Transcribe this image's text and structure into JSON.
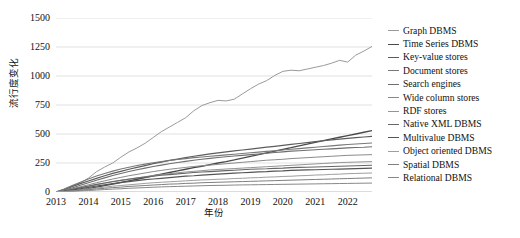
{
  "chart_data": {
    "type": "line",
    "title": "",
    "xlabel": "年份",
    "ylabel": "流行度变化",
    "xlim": [
      2013.0,
      2022.75
    ],
    "ylim": [
      0,
      1500
    ],
    "yticks": [
      0,
      250,
      500,
      750,
      1000,
      1250,
      1500
    ],
    "xticks": [
      2013,
      2014,
      2015,
      2016,
      2017,
      2018,
      2019,
      2020,
      2021,
      2022
    ],
    "grid": "horizontal",
    "legend_position": "right",
    "x": [
      2013.0,
      2013.25,
      2013.5,
      2013.75,
      2014.0,
      2014.25,
      2014.5,
      2014.75,
      2015.0,
      2015.25,
      2015.5,
      2015.75,
      2016.0,
      2016.25,
      2016.5,
      2016.75,
      2017.0,
      2017.25,
      2017.5,
      2017.75,
      2018.0,
      2018.25,
      2018.5,
      2018.75,
      2019.0,
      2019.25,
      2019.5,
      2019.75,
      2020.0,
      2020.25,
      2020.5,
      2020.75,
      2021.0,
      2021.25,
      2021.5,
      2021.75,
      2022.0,
      2022.25,
      2022.5,
      2022.75
    ],
    "series": [
      {
        "name": "Graph DBMS",
        "color": "#9a9a9a",
        "width": 1.0,
        "values": [
          0,
          18,
          45,
          78,
          120,
          175,
          215,
          250,
          300,
          345,
          380,
          420,
          470,
          520,
          560,
          600,
          640,
          700,
          745,
          770,
          790,
          785,
          800,
          845,
          890,
          930,
          960,
          1005,
          1040,
          1050,
          1045,
          1060,
          1075,
          1090,
          1110,
          1135,
          1120,
          1180,
          1215,
          1255
        ]
      },
      {
        "name": "Time Series DBMS",
        "color": "#4a4a4a",
        "width": 1.3,
        "values": [
          0,
          5,
          12,
          20,
          30,
          42,
          55,
          68,
          82,
          96,
          110,
          125,
          140,
          155,
          168,
          182,
          196,
          210,
          222,
          236,
          250,
          262,
          276,
          292,
          308,
          322,
          338,
          352,
          368,
          382,
          398,
          412,
          428,
          442,
          458,
          472,
          486,
          500,
          515,
          530
        ]
      },
      {
        "name": "Key-value stores",
        "color": "#5c5c5c",
        "width": 1.2,
        "values": [
          0,
          22,
          48,
          72,
          95,
          118,
          140,
          160,
          178,
          196,
          212,
          228,
          244,
          258,
          272,
          284,
          296,
          308,
          318,
          328,
          338,
          346,
          354,
          362,
          370,
          378,
          386,
          394,
          402,
          410,
          418,
          426,
          434,
          442,
          450,
          456,
          462,
          468,
          474,
          480
        ]
      },
      {
        "name": "Document stores",
        "color": "#787878",
        "width": 1.1,
        "values": [
          0,
          25,
          55,
          85,
          112,
          138,
          160,
          180,
          198,
          214,
          228,
          240,
          252,
          262,
          272,
          280,
          288,
          296,
          302,
          308,
          314,
          320,
          326,
          332,
          338,
          344,
          350,
          356,
          362,
          368,
          374,
          380,
          386,
          392,
          398,
          404,
          410,
          414,
          418,
          422
        ]
      },
      {
        "name": "Search engines",
        "color": "#6e6e6e",
        "width": 1.1,
        "values": [
          0,
          15,
          35,
          58,
          80,
          102,
          122,
          142,
          160,
          176,
          192,
          206,
          220,
          232,
          244,
          254,
          264,
          274,
          282,
          290,
          298,
          304,
          310,
          316,
          322,
          328,
          334,
          340,
          346,
          352,
          356,
          360,
          364,
          368,
          372,
          376,
          380,
          384,
          386,
          390
        ]
      },
      {
        "name": "Wide column stores",
        "color": "#8a8a8a",
        "width": 1.0,
        "values": [
          0,
          12,
          28,
          45,
          62,
          80,
          96,
          112,
          126,
          140,
          152,
          164,
          176,
          186,
          196,
          204,
          212,
          220,
          226,
          232,
          238,
          244,
          250,
          256,
          262,
          268,
          274,
          278,
          282,
          288,
          292,
          296,
          300,
          304,
          308,
          312,
          316,
          318,
          320,
          322
        ]
      },
      {
        "name": "RDF stores",
        "color": "#949494",
        "width": 1.0,
        "values": [
          0,
          8,
          20,
          34,
          48,
          62,
          76,
          88,
          100,
          112,
          122,
          132,
          142,
          150,
          158,
          166,
          172,
          178,
          184,
          190,
          194,
          198,
          202,
          206,
          210,
          214,
          218,
          222,
          226,
          230,
          234,
          238,
          242,
          246,
          250,
          254,
          256,
          258,
          260,
          262
        ]
      },
      {
        "name": "Native XML DBMS",
        "color": "#666666",
        "width": 1.1,
        "values": [
          0,
          10,
          24,
          38,
          52,
          66,
          78,
          90,
          100,
          110,
          120,
          128,
          136,
          144,
          150,
          156,
          162,
          168,
          172,
          176,
          180,
          184,
          188,
          192,
          196,
          198,
          200,
          204,
          206,
          210,
          212,
          214,
          216,
          218,
          220,
          222,
          224,
          226,
          228,
          230
        ]
      },
      {
        "name": "Multivalue DBMS",
        "color": "#555555",
        "width": 1.2,
        "values": [
          0,
          6,
          16,
          28,
          40,
          52,
          62,
          72,
          82,
          90,
          98,
          106,
          112,
          118,
          124,
          130,
          136,
          140,
          146,
          150,
          154,
          158,
          162,
          166,
          170,
          174,
          176,
          180,
          182,
          186,
          188,
          190,
          192,
          194,
          196,
          198,
          200,
          202,
          204,
          206
        ]
      },
      {
        "name": "Object oriented DBMS",
        "color": "#9e9e9e",
        "width": 1.0,
        "values": [
          0,
          4,
          10,
          18,
          26,
          34,
          42,
          50,
          56,
          62,
          68,
          74,
          80,
          84,
          88,
          92,
          96,
          100,
          104,
          106,
          110,
          112,
          116,
          118,
          122,
          124,
          128,
          130,
          134,
          136,
          140,
          142,
          146,
          148,
          152,
          154,
          158,
          160,
          162,
          164
        ]
      },
      {
        "name": "Spatial DBMS",
        "color": "#7f7f7f",
        "width": 1.0,
        "values": [
          0,
          3,
          8,
          14,
          20,
          26,
          32,
          38,
          42,
          48,
          52,
          56,
          60,
          64,
          68,
          70,
          74,
          76,
          80,
          82,
          84,
          86,
          88,
          90,
          92,
          94,
          96,
          98,
          100,
          102,
          104,
          106,
          108,
          110,
          112,
          114,
          116,
          118,
          120,
          122
        ]
      },
      {
        "name": "Relational DBMS",
        "color": "#888888",
        "width": 1.0,
        "values": [
          0,
          2,
          5,
          9,
          13,
          17,
          21,
          25,
          28,
          32,
          35,
          38,
          41,
          44,
          46,
          48,
          50,
          52,
          54,
          56,
          57,
          58,
          60,
          61,
          62,
          63,
          64,
          65,
          66,
          67,
          68,
          69,
          70,
          71,
          72,
          73,
          74,
          75,
          76,
          77
        ]
      }
    ]
  },
  "caption": ""
}
